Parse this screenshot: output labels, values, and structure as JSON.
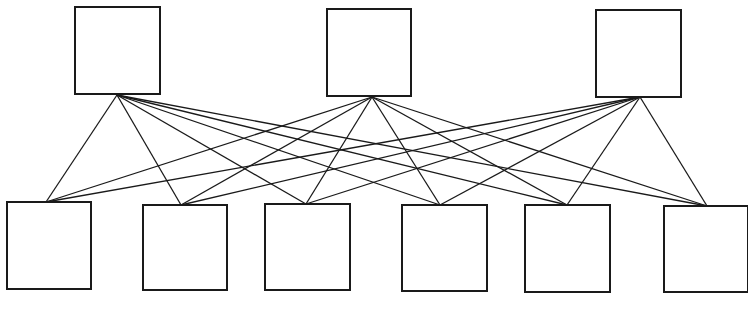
{
  "diagram": {
    "type": "complete-bipartite-network",
    "colors": {
      "stroke": "#1a1a1a",
      "fill": "#ffffff",
      "background": "#ffffff"
    },
    "top_layer": [
      {
        "id": "T1",
        "x": 75,
        "y": 7,
        "w": 85,
        "h": 87,
        "anchor": [
          117,
          95
        ]
      },
      {
        "id": "T2",
        "x": 327,
        "y": 9,
        "w": 84,
        "h": 87,
        "anchor": [
          372,
          97
        ]
      },
      {
        "id": "T3",
        "x": 596,
        "y": 10,
        "w": 85,
        "h": 87,
        "anchor": [
          640,
          97
        ]
      }
    ],
    "bottom_layer": [
      {
        "id": "B1",
        "x": 7,
        "y": 202,
        "w": 84,
        "h": 87,
        "anchor": [
          46,
          202
        ]
      },
      {
        "id": "B2",
        "x": 143,
        "y": 205,
        "w": 84,
        "h": 85,
        "anchor": [
          181,
          205
        ]
      },
      {
        "id": "B3",
        "x": 265,
        "y": 204,
        "w": 85,
        "h": 86,
        "anchor": [
          306,
          204
        ]
      },
      {
        "id": "B4",
        "x": 402,
        "y": 205,
        "w": 85,
        "h": 86,
        "anchor": [
          440,
          205
        ]
      },
      {
        "id": "B5",
        "x": 525,
        "y": 205,
        "w": 85,
        "h": 87,
        "anchor": [
          567,
          205
        ]
      },
      {
        "id": "B6",
        "x": 664,
        "y": 206,
        "w": 84,
        "h": 86,
        "anchor": [
          707,
          206
        ]
      }
    ],
    "connectivity": "every top node connects to every bottom node (18 edges)",
    "caption": ""
  }
}
